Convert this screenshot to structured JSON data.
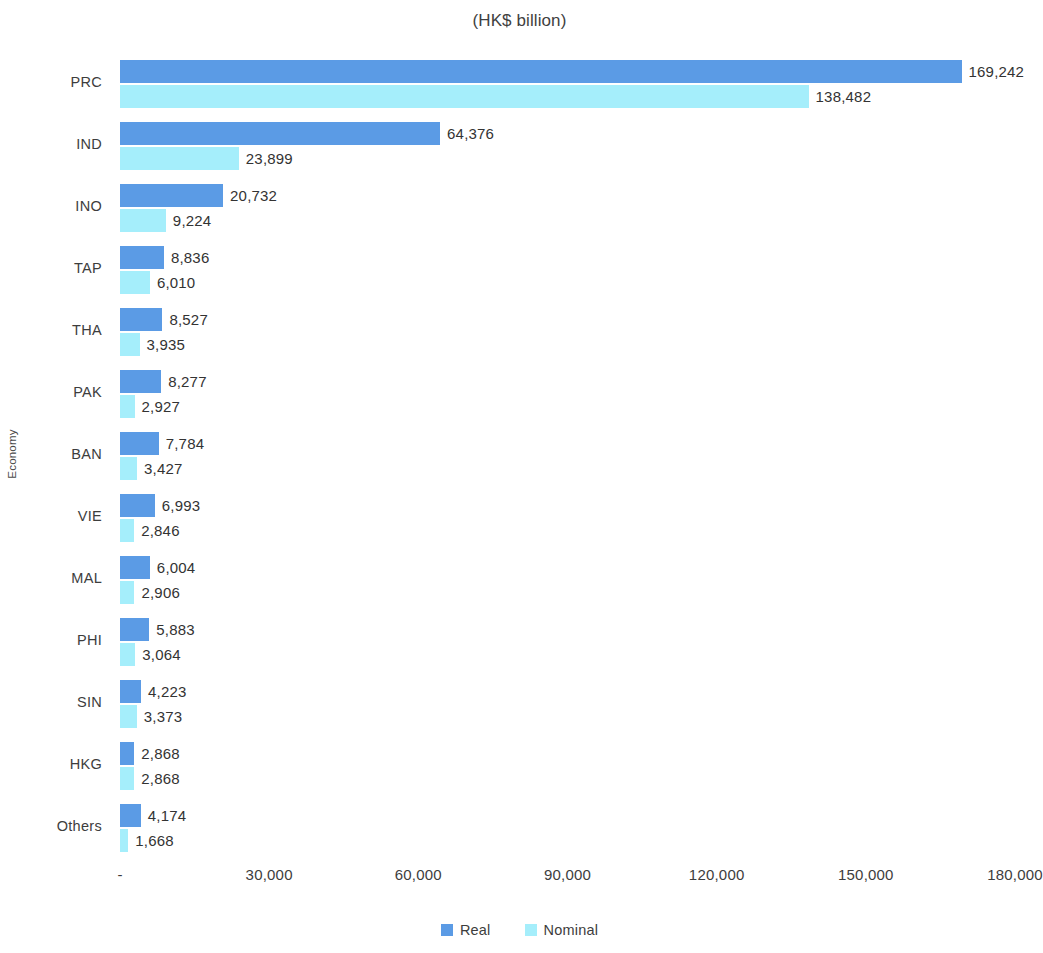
{
  "chart_data": {
    "type": "bar",
    "orientation": "horizontal",
    "title": "",
    "subtitle": "(HK$ billion)",
    "xlabel": "",
    "ylabel": "Economy",
    "xlim": [
      0,
      180000
    ],
    "xticks": [
      "-",
      "30,000",
      "60,000",
      "90,000",
      "120,000",
      "150,000",
      "180,000"
    ],
    "xtick_values": [
      0,
      30000,
      60000,
      90000,
      120000,
      150000,
      180000
    ],
    "grid": false,
    "legend_position": "bottom",
    "categories": [
      "PRC",
      "IND",
      "INO",
      "TAP",
      "THA",
      "PAK",
      "BAN",
      "VIE",
      "MAL",
      "PHI",
      "SIN",
      "HKG",
      "Others"
    ],
    "series": [
      {
        "name": "Real",
        "color": "#5B9BE5",
        "values": [
          169242,
          64376,
          20732,
          8836,
          8527,
          8277,
          7784,
          6993,
          6004,
          5883,
          4223,
          2868,
          4174
        ],
        "labels": [
          "169,242",
          "64,376",
          "20,732",
          "8,836",
          "8,527",
          "8,277",
          "7,784",
          "6,993",
          "6,004",
          "5,883",
          "4,223",
          "2,868",
          "4,174"
        ]
      },
      {
        "name": "Nominal",
        "color": "#A5EEFB",
        "values": [
          138482,
          23899,
          9224,
          6010,
          3935,
          2927,
          3427,
          2846,
          2906,
          3064,
          3373,
          2868,
          1668
        ],
        "labels": [
          "138,482",
          "23,899",
          "9,224",
          "6,010",
          "3,935",
          "2,927",
          "3,427",
          "2,846",
          "2,906",
          "3,064",
          "3,373",
          "2,868",
          "1,668"
        ]
      }
    ]
  },
  "legend": {
    "items": [
      {
        "label": "Real",
        "color": "#5B9BE5"
      },
      {
        "label": "Nominal",
        "color": "#A5EEFB"
      }
    ]
  }
}
